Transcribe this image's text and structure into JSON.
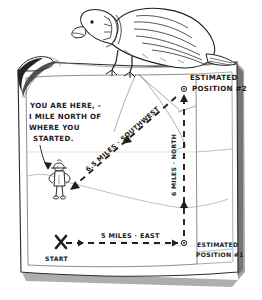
{
  "scene": {
    "title": "Hand-drawn navigation map sketch",
    "medium": "pen-and-ink drawing",
    "background_color": "#ffffff",
    "ink_color": "#1f1f1f"
  },
  "map_sheet": {
    "name": "map-sheet",
    "description": "Rectangular sheet of paper with curled torn top-left corner and drop shadow at right and bottom edges",
    "corner_curl": "top-left"
  },
  "illustrations": {
    "bird": {
      "name": "vulture-bird",
      "description": "Large hunched bird perched on the top edge of the map, head lowered and peering down at the map"
    },
    "hiker": {
      "name": "hiker-figure",
      "description": "Small standing person drawn at the current position on the map"
    }
  },
  "annotations": {
    "you_are_here": {
      "lines": [
        "YOU ARE HERE, -",
        "I MILE NORTH OF",
        "WHERE YOU",
        "STARTED."
      ]
    },
    "leg_east": {
      "label": "5 MILES · EAST",
      "direction": "east",
      "distance_miles": 5
    },
    "leg_north": {
      "label": "6 MILES · NORTH",
      "direction": "north",
      "distance_miles": 6
    },
    "leg_southwest": {
      "label": "6.5 MILES · SOUTHWEST",
      "direction": "southwest",
      "distance_miles": 6.5
    },
    "start": {
      "label": "START",
      "marker": "x-marker"
    },
    "estimated_position_1": {
      "line1": "ESTIMATED",
      "line2": "POSITION #1",
      "marker": "circle-dot-marker"
    },
    "estimated_position_2": {
      "line1": "ESTIMATED",
      "line2": "POSITION #2",
      "marker": "circle-dot-marker"
    }
  },
  "terrain": {
    "name": "contour-lines",
    "description": "Faint thin curving contour and boundary lines across the map surface"
  }
}
